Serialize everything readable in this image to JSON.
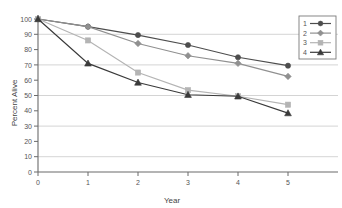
{
  "chart_data": {
    "type": "line",
    "title": "",
    "subtitle": "",
    "xlabel": "Year",
    "ylabel": "Percent Alive",
    "x": [
      0,
      1,
      2,
      3,
      4,
      5
    ],
    "categories": [
      "0",
      "1",
      "2",
      "3",
      "4",
      "5"
    ],
    "xtick_labels": [
      "0",
      "1",
      "2",
      "3",
      "4",
      "5"
    ],
    "ytick_labels": [
      "0",
      "10",
      "20",
      "30",
      "40",
      "50",
      "60",
      "70",
      "80",
      "90",
      "100"
    ],
    "ytick_values": [
      0,
      10,
      20,
      30,
      40,
      50,
      60,
      70,
      80,
      90,
      100
    ],
    "xlim": [
      0,
      5
    ],
    "ylim": [
      0,
      100
    ],
    "grid": "horizontal-major-only",
    "gridlines_at": [
      10,
      30,
      50,
      70,
      90
    ],
    "legend_position": "top-right",
    "legend_entries": [
      "1",
      "2",
      "3",
      "4"
    ],
    "series": [
      {
        "name": "1",
        "marker": "circle",
        "color": "#4d4d4d",
        "values": [
          100,
          95,
          89.5,
          83,
          75,
          69.5
        ]
      },
      {
        "name": "2",
        "marker": "diamond",
        "color": "#909090",
        "values": [
          100,
          95,
          84,
          76,
          71,
          62.5
        ]
      },
      {
        "name": "3",
        "marker": "square",
        "color": "#b4b4b4",
        "values": [
          100,
          86,
          65,
          53.5,
          49.5,
          44
        ]
      },
      {
        "name": "4",
        "marker": "triangle",
        "color": "#3a3a3a",
        "values": [
          100,
          71,
          58.5,
          50.5,
          49.5,
          38.5
        ]
      }
    ]
  },
  "colors": {
    "axis": "#6b6b6b",
    "grid": "#c9c9c9",
    "background": "#ffffff",
    "text": "#555555",
    "legend_border": "#7a7a7a"
  },
  "legend": {
    "items": [
      {
        "label": "1",
        "marker": "circle-marker-icon",
        "color": "#4d4d4d"
      },
      {
        "label": "2",
        "marker": "diamond-marker-icon",
        "color": "#909090"
      },
      {
        "label": "3",
        "marker": "square-marker-icon",
        "color": "#b4b4b4"
      },
      {
        "label": "4",
        "marker": "triangle-marker-icon",
        "color": "#3a3a3a"
      }
    ]
  },
  "axes": {
    "x_title": "Year",
    "y_title": "Percent Alive"
  }
}
